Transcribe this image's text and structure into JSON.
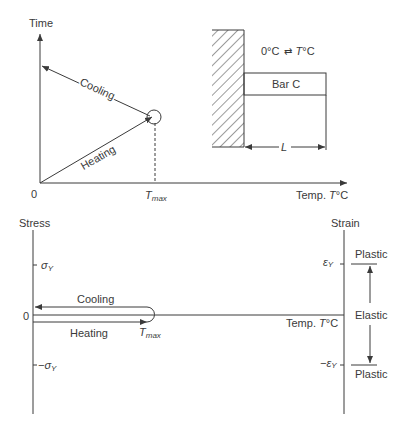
{
  "top_diagram": {
    "y_axis_label": "Time",
    "x_axis_label_prefix": "Temp. ",
    "x_axis_label_var": "T",
    "x_axis_label_unit": "°C",
    "origin_label": "0",
    "tmax_label_main": "T",
    "tmax_label_sub": "max",
    "cooling_label": "Cooling",
    "heating_label": "Heating"
  },
  "bar_schematic": {
    "temp_range_start": "0°C",
    "temp_range_arrow": "⇄",
    "temp_range_end_var": "T",
    "temp_range_end_unit": "°C",
    "bar_label": "Bar C",
    "length_label": "L"
  },
  "bottom_diagram": {
    "stress_axis_label": "Stress",
    "strain_axis_label": "Strain",
    "sigma_y_pos": "σ",
    "sigma_y_neg": "−σ",
    "sigma_sub": "Y",
    "origin_label": "0",
    "cooling_label": "Cooling",
    "heating_label": "Heating",
    "tmax_label_main": "T",
    "tmax_label_sub": "max",
    "temp_axis_label_prefix": "Temp. ",
    "temp_axis_label_var": "T",
    "temp_axis_label_unit": "°C",
    "eps_y_pos": "ε",
    "eps_y_neg": "−ε",
    "eps_sub": "Y",
    "region_plastic_top": "Plastic",
    "region_elastic": "Elastic",
    "region_plastic_bottom": "Plastic"
  },
  "colors": {
    "line": "#3a3a3a",
    "background": "#ffffff"
  }
}
